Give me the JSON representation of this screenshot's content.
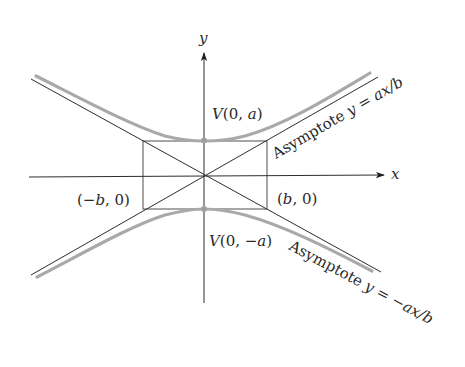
{
  "figure": {
    "type": "hyperbola",
    "orientation": "vertical-transverse-axis",
    "axes": {
      "x_label": "x",
      "y_label": "y"
    },
    "vertices": {
      "upper": {
        "label": "V(0, a)",
        "V": "V",
        "open": "(0, ",
        "var": "a",
        "close": ")"
      },
      "lower": {
        "label": "V(0, −a)",
        "V": "V",
        "open": "(0, −",
        "var": "a",
        "close": ")"
      }
    },
    "co_vertices": {
      "left": {
        "label": "(−b, 0)",
        "open": "(−",
        "var": "b",
        "close": ", 0)"
      },
      "right": {
        "label": "(b, 0)",
        "open": "(",
        "var": "b",
        "close": ", 0)"
      }
    },
    "asymptotes": {
      "positive": {
        "prefix": "Asymptote ",
        "y": "y",
        "eq": " = ",
        "expr": "ax/b"
      },
      "negative": {
        "prefix": "Asymptote ",
        "y": "y",
        "eq": " = −",
        "expr": "ax/b"
      }
    },
    "colors": {
      "line": "#2e2e2e",
      "curve": "#a9a9a9",
      "vertex": "#a0a0a0",
      "text": "#2a2a2a",
      "background": "#ffffff"
    }
  }
}
